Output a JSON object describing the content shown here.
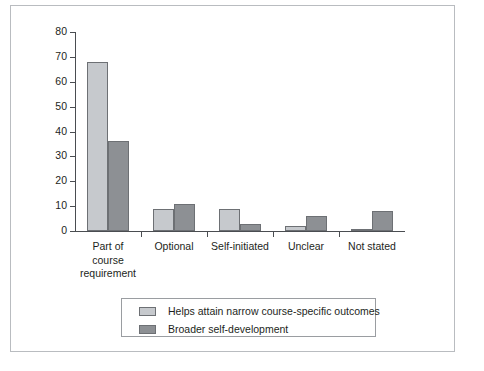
{
  "chart_data": {
    "type": "bar",
    "title": "",
    "subtitle": "",
    "xlabel": "",
    "ylabel": "",
    "ylim": [
      0,
      80
    ],
    "ytick_labels": [
      "80",
      "70",
      "60",
      "50",
      "40",
      "30",
      "20",
      "10",
      "0"
    ],
    "ytick_values": [
      80,
      70,
      60,
      50,
      40,
      30,
      20,
      10,
      0
    ],
    "grid": false,
    "legend_position": "bottom-center",
    "categories": [
      "Part of\ncourse\nrequirement",
      "Optional",
      "Self-initiated",
      "Unclear",
      "Not stated"
    ],
    "series": [
      {
        "name": "Helps attain narrow course-specific outcomes",
        "color": "#c6c9cd",
        "values": [
          68,
          9,
          9,
          2,
          1
        ]
      },
      {
        "name": "Broader self-development",
        "color": "#8d9094",
        "values": [
          36,
          11,
          3,
          6,
          8
        ]
      }
    ]
  },
  "legend": {
    "items": [
      {
        "label": "Helps attain narrow course-specific outcomes",
        "swatch": "series-light"
      },
      {
        "label": "Broader self-development",
        "swatch": "series-dark"
      }
    ]
  },
  "axes": {
    "y_ticks": [
      {
        "label": "80",
        "value": 80
      },
      {
        "label": "70",
        "value": 70
      },
      {
        "label": "60",
        "value": 60
      },
      {
        "label": "50",
        "value": 50
      },
      {
        "label": "40",
        "value": 40
      },
      {
        "label": "30",
        "value": 30
      },
      {
        "label": "20",
        "value": 20
      },
      {
        "label": "10",
        "value": 10
      },
      {
        "label": "0",
        "value": 0
      }
    ],
    "categories": [
      "Part of\ncourse\nrequirement",
      "Optional",
      "Self-initiated",
      "Unclear",
      "Not stated"
    ]
  },
  "colors": {
    "series_light": "#c6c9cd",
    "series_dark": "#8d9094",
    "axis": "#4a4d51",
    "frame": "#b9bcc0",
    "text": "#1d1f22"
  }
}
